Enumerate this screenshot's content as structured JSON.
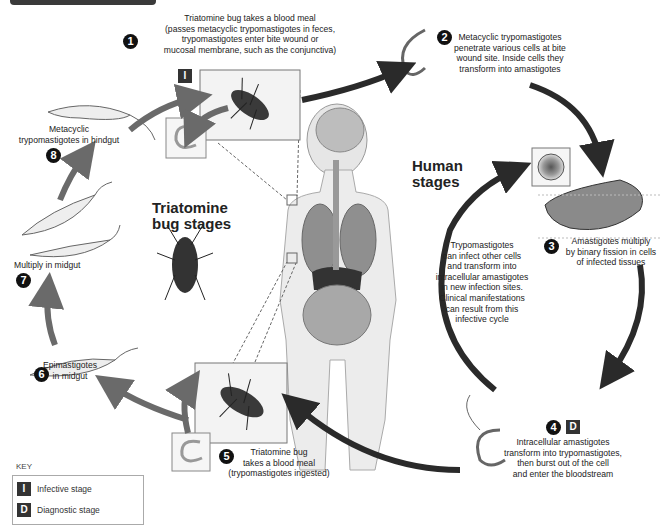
{
  "header": {
    "bar": "cropped-title-bar"
  },
  "headings": {
    "human": [
      "Human",
      "stages"
    ],
    "bug": [
      "Triatomine",
      "bug stages"
    ]
  },
  "stages": [
    {
      "number": "1",
      "badge": "I",
      "lines": [
        "Triatomine bug takes a blood meal",
        "(passes metacyclic trypomastigotes in feces,",
        "trypomastigotes enter bite wound or",
        "mucosal membrane, such as the conjunctiva)"
      ]
    },
    {
      "number": "2",
      "lines": [
        "Metacyclic trypomastigotes",
        "penetrate various cells at bite",
        "wound site. Inside cells they",
        "transform into amastigotes"
      ]
    },
    {
      "number": "3",
      "lines": [
        "Amastigotes multiply",
        "by binary fission in cells",
        "of infected tissues"
      ]
    },
    {
      "number": "4",
      "badge": "D",
      "lines": [
        "Intracellular amastigotes",
        "transform into trypomastigotes,",
        "then burst out of the cell",
        "and enter the bloodstream"
      ]
    },
    {
      "number": "5",
      "lines": [
        "Triatomine bug",
        "takes a blood meal",
        "(trypomastigotes ingested)"
      ]
    },
    {
      "number": "6",
      "lines": [
        "Epimastigotes",
        "in midgut"
      ]
    },
    {
      "number": "7",
      "lines": [
        "Multiply in midgut"
      ]
    },
    {
      "number": "8",
      "lines": [
        "Metacyclic",
        "trypomastigotes in hindgut"
      ]
    }
  ],
  "center_note": [
    "Trypomastigotes",
    "can infect other cells",
    "and transform into",
    "intracellular amastigotes",
    "in new infection sites.",
    "Clinical manifestations",
    "can result from this",
    "infective cycle"
  ],
  "key": {
    "title": "KEY",
    "items": [
      {
        "badge": "I",
        "label": "Infective stage"
      },
      {
        "badge": "D",
        "label": "Diagnostic stage"
      }
    ]
  },
  "colors": {
    "arrow_dark": "#2a2a2a",
    "arrow_mid": "#6a6a6a",
    "badge": "#333333",
    "panel_border": "#777777"
  }
}
